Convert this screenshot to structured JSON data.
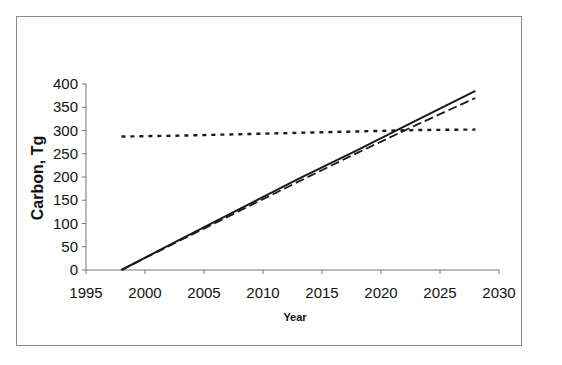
{
  "chart_data": {
    "type": "line",
    "title": "",
    "xlabel": "Year",
    "ylabel": "Carbon, Tg",
    "xlim": [
      1995,
      2030
    ],
    "ylim": [
      0,
      400
    ],
    "xticks": [
      1995,
      2000,
      2005,
      2010,
      2015,
      2020,
      2025,
      2030
    ],
    "yticks": [
      0,
      50,
      100,
      150,
      200,
      250,
      300,
      350,
      400
    ],
    "grid": false,
    "legend": null,
    "series": [
      {
        "name": "solid",
        "style": "solid",
        "x": [
          1998,
          2003,
          2008,
          2013,
          2018,
          2023,
          2028
        ],
        "y": [
          0,
          66,
          131,
          196,
          258,
          322,
          385
        ]
      },
      {
        "name": "dashed",
        "style": "dashed",
        "x": [
          1998,
          2003,
          2008,
          2013,
          2018,
          2023,
          2028
        ],
        "y": [
          0,
          64,
          127,
          190,
          252,
          312,
          370
        ]
      },
      {
        "name": "dotted",
        "style": "dotted",
        "x": [
          1998,
          2003,
          2008,
          2013,
          2018,
          2023,
          2028
        ],
        "y": [
          287,
          289,
          292,
          295,
          298,
          301,
          302
        ]
      }
    ]
  }
}
